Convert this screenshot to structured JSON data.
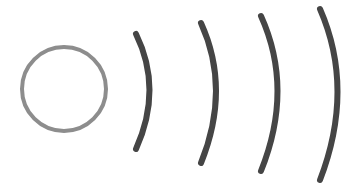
{
  "figure": {
    "background_color": "#ffffff",
    "width": 363,
    "height": 185
  },
  "palette": {
    "source_stroke": "#8d8d8d",
    "wave_stroke": "#454545",
    "background": "#ffffff"
  },
  "source": {
    "name": "source-circle",
    "shape": "circle",
    "cx": 64,
    "cy": 89,
    "r": 42,
    "stroke_width": 4,
    "stroke_color": "#8d8d8d"
  },
  "waves": [
    {
      "name": "wave-arc-1",
      "index": 1,
      "label": "Wave 1",
      "path": "M 136 34 Q 163 89 136 149",
      "stroke_width": 6,
      "stroke_color": "#454545",
      "top_y": 34,
      "bottom_y": 149,
      "apex_x": 157
    },
    {
      "name": "wave-arc-2",
      "index": 2,
      "label": "Wave 2",
      "path": "M 201 23 Q 231 89 201 163",
      "stroke_width": 6,
      "stroke_color": "#454545",
      "top_y": 23,
      "bottom_y": 163,
      "apex_x": 222
    },
    {
      "name": "wave-arc-3",
      "index": 3,
      "label": "Wave 3",
      "path": "M 261 16 Q 294 89 261 171",
      "stroke_width": 6,
      "stroke_color": "#454545",
      "top_y": 16,
      "bottom_y": 171,
      "apex_x": 284
    },
    {
      "name": "wave-arc-4",
      "index": 4,
      "label": "Wave 4",
      "path": "M 320 9 Q 355 89 320 180",
      "stroke_width": 6,
      "stroke_color": "#454545",
      "top_y": 9,
      "bottom_y": 180,
      "apex_x": 343
    }
  ]
}
